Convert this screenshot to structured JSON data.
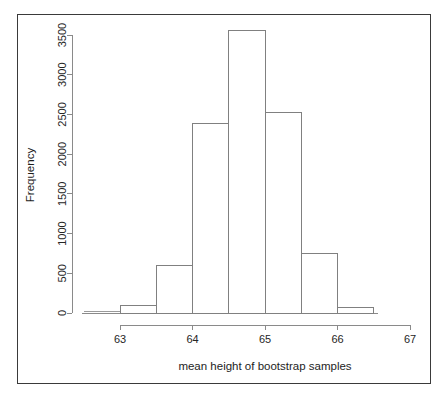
{
  "figure": {
    "background_color": "#ffffff",
    "frame_color": "#3a3a3a",
    "axis_color": "#8a8a8a",
    "bar_border_color": "#808080",
    "bar_fill_color": "#ffffff"
  },
  "chart_data": {
    "type": "bar",
    "title": "",
    "subtitle": "",
    "xlabel": "mean height of bootstrap samples",
    "ylabel": "Frequency",
    "xlim": [
      62.5,
      66.5
    ],
    "ylim": [
      0,
      3560
    ],
    "grid": false,
    "legend": null,
    "bin_width": 0.5,
    "x_ticks": [
      63,
      64,
      65,
      66,
      67
    ],
    "x_tick_labels": [
      "63",
      "64",
      "65",
      "66",
      "67"
    ],
    "y_ticks": [
      0,
      500,
      1000,
      1500,
      2000,
      2500,
      3000,
      3500
    ],
    "y_tick_labels": [
      "0",
      "500",
      "1000",
      "1500",
      "2000",
      "2500",
      "3000",
      "3500"
    ],
    "bins": [
      {
        "left": 62.5,
        "right": 63.0,
        "value": 5
      },
      {
        "left": 63.0,
        "right": 63.5,
        "value": 90
      },
      {
        "left": 63.5,
        "right": 64.0,
        "value": 600
      },
      {
        "left": 64.0,
        "right": 64.5,
        "value": 2390
      },
      {
        "left": 64.5,
        "right": 65.0,
        "value": 3560
      },
      {
        "left": 65.0,
        "right": 65.5,
        "value": 2530
      },
      {
        "left": 65.5,
        "right": 66.0,
        "value": 750
      },
      {
        "left": 66.0,
        "right": 66.5,
        "value": 70
      }
    ],
    "categories": [
      "62.5-63",
      "63-63.5",
      "63.5-64",
      "64-64.5",
      "64.5-65",
      "65-65.5",
      "65.5-66",
      "66-66.5"
    ],
    "values": [
      5,
      90,
      600,
      2390,
      3560,
      2530,
      750,
      70
    ]
  },
  "axes": {
    "y_axis_title": "Frequency",
    "x_axis_title": "mean height of bootstrap samples"
  }
}
